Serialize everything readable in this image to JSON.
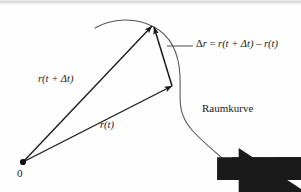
{
  "figure": {
    "language": "de",
    "background_color": "#fefefe",
    "ink_color": "#1a1a1a",
    "curve_color": "#555555",
    "top_border_color": "#b9b9b9",
    "width": 301,
    "height": 192
  },
  "labels": {
    "delta_r_equation": {
      "full_text": "Δr⃗ = r⃗(t + Δt) − r⃗(t)",
      "delta_symbol": "Δ",
      "vector_symbol": "r",
      "equals": " = ",
      "arg_first": "(t + Δt)",
      "minus": " – ",
      "arg_second": "(t)"
    },
    "r_t_plus_dt": {
      "full_text": "r⃗(t + Δt)",
      "vector_symbol": "r",
      "argument": "(t + Δt)"
    },
    "r_t": {
      "full_text": "r⃗(t)",
      "vector_symbol": "r",
      "argument": "(t)"
    },
    "raumkurve": "Raumkurve",
    "origin": "0"
  },
  "geometry": {
    "origin_point": {
      "x": 23,
      "y": 162
    },
    "tip_r_t_plus_dt": {
      "x": 152,
      "y": 26
    },
    "tip_r_t": {
      "x": 172,
      "y": 86
    },
    "leader_line": {
      "x1": 170,
      "y1": 46,
      "x2": 193,
      "y2": 46
    },
    "curve_start": {
      "x": 95,
      "y": 28
    },
    "curve_end": {
      "x": 238,
      "y": 173
    }
  }
}
